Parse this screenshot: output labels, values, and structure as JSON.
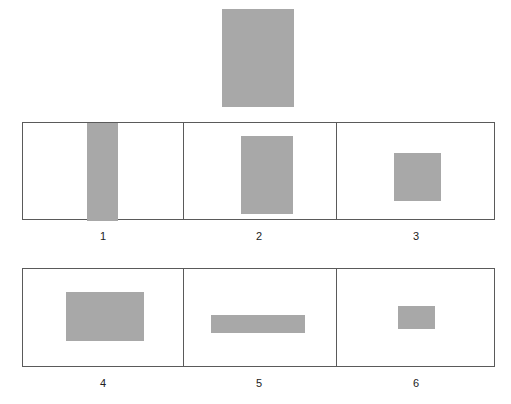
{
  "figure": {
    "background_color": "#ffffff",
    "shape_fill_color": "#a8a8a8",
    "frame_border_color": "#5a5a5a",
    "caption_color": "#222222"
  },
  "stimulus": {
    "name": "reference-rectangle",
    "x": 222,
    "y": 9,
    "width": 72,
    "height": 98,
    "fill": "#a8a8a8"
  },
  "rows": [
    {
      "name": "row-top",
      "x": 22,
      "y": 122,
      "width": 473,
      "height": 98,
      "panels": [
        {
          "label": "1",
          "panel_width": 161,
          "shape": {
            "x": 64,
            "y": 0,
            "width": 31,
            "height": 98,
            "fill": "#a8a8a8"
          }
        },
        {
          "label": "2",
          "panel_width": 153,
          "shape": {
            "x": 57,
            "y": 13,
            "width": 52,
            "height": 78,
            "fill": "#a8a8a8"
          }
        },
        {
          "label": "3",
          "panel_width": 159,
          "shape": {
            "x": 57,
            "y": 30,
            "width": 47,
            "height": 48,
            "fill": "#a8a8a8"
          }
        }
      ]
    },
    {
      "name": "row-bottom",
      "x": 22,
      "y": 268,
      "width": 473,
      "height": 99,
      "panels": [
        {
          "label": "4",
          "panel_width": 161,
          "shape": {
            "x": 43,
            "y": 23,
            "width": 78,
            "height": 49,
            "fill": "#a8a8a8"
          }
        },
        {
          "label": "5",
          "panel_width": 153,
          "shape": {
            "x": 27,
            "y": 46,
            "width": 94,
            "height": 18,
            "fill": "#a8a8a8"
          }
        },
        {
          "label": "6",
          "panel_width": 159,
          "shape": {
            "x": 61,
            "y": 37,
            "width": 37,
            "height": 23,
            "fill": "#a8a8a8"
          }
        }
      ]
    }
  ],
  "captions": [
    {
      "text": "1",
      "center_x": 103,
      "y": 231
    },
    {
      "text": "2",
      "center_x": 259,
      "y": 231
    },
    {
      "text": "3",
      "center_x": 416,
      "y": 231
    },
    {
      "text": "4",
      "center_x": 103,
      "y": 378
    },
    {
      "text": "5",
      "center_x": 259,
      "y": 378
    },
    {
      "text": "6",
      "center_x": 416,
      "y": 378
    }
  ]
}
